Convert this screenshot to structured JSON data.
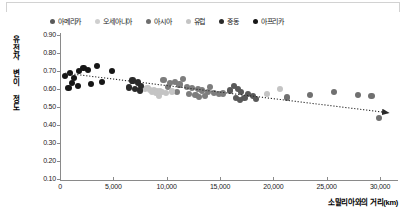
{
  "chart_data": {
    "type": "scatter",
    "title": "",
    "xlabel": "소말리아와의 거리(km)",
    "ylabel": "유전자 변이 정도",
    "xlim": [
      0,
      31500
    ],
    "ylim": [
      0.1,
      0.9
    ],
    "xticks": [
      0,
      5000,
      10000,
      15000,
      20000,
      25000,
      30000
    ],
    "xtick_labels": [
      "0",
      "5,000",
      "10,000",
      "15,000",
      "20,000",
      "25,000",
      "30,000"
    ],
    "yticks": [
      0.1,
      0.2,
      0.3,
      0.4,
      0.5,
      0.6,
      0.7,
      0.8,
      0.9
    ],
    "ytick_labels": [
      "0.10",
      "0.20",
      "0.30",
      "0.40",
      "0.50",
      "0.60",
      "0.70",
      "0.80",
      "0.90"
    ],
    "grid": false,
    "legend_position": "top",
    "trendline": {
      "type": "linear-arrow",
      "x_start": 500,
      "y_start": 0.688,
      "x_end": 30800,
      "y_end": 0.468,
      "style": "dotted",
      "color": "#2b2b2b",
      "arrowhead": true
    },
    "series": [
      {
        "name": "아메리카",
        "color": "#595959",
        "points": [
          [
            16300,
            0.617
          ],
          [
            16700,
            0.6
          ],
          [
            17000,
            0.585
          ],
          [
            17600,
            0.572
          ],
          [
            18100,
            0.563
          ],
          [
            15900,
            0.592
          ],
          [
            16500,
            0.552
          ],
          [
            17300,
            0.548
          ],
          [
            18400,
            0.545
          ],
          [
            16900,
            0.541
          ]
        ]
      },
      {
        "name": "오세아니아",
        "color": "#707070",
        "points": [
          [
            23400,
            0.567
          ],
          [
            25700,
            0.584
          ],
          [
            27900,
            0.565
          ],
          [
            29200,
            0.56
          ],
          [
            29900,
            0.439
          ],
          [
            21300,
            0.553
          ]
        ]
      },
      {
        "name": "아시아",
        "color": "#7d7d7d",
        "points": [
          [
            9700,
            0.648
          ],
          [
            10300,
            0.633
          ],
          [
            10800,
            0.64
          ],
          [
            11200,
            0.625
          ],
          [
            11900,
            0.612
          ],
          [
            12400,
            0.604
          ],
          [
            12900,
            0.598
          ],
          [
            13300,
            0.592
          ],
          [
            13900,
            0.585
          ],
          [
            14400,
            0.58
          ],
          [
            14900,
            0.573
          ],
          [
            12100,
            0.571
          ],
          [
            12700,
            0.565
          ],
          [
            13600,
            0.56
          ],
          [
            11500,
            0.657
          ],
          [
            10100,
            0.612
          ],
          [
            14100,
            0.612
          ],
          [
            15300,
            0.575
          ],
          [
            11000,
            0.585
          ],
          [
            13000,
            0.554
          ]
        ]
      },
      {
        "name": "유럽",
        "color": "#c4c4c4",
        "points": [
          [
            8000,
            0.6
          ],
          [
            8400,
            0.596
          ],
          [
            8800,
            0.592
          ],
          [
            9100,
            0.59
          ],
          [
            9400,
            0.588
          ],
          [
            8600,
            0.583
          ],
          [
            9000,
            0.58
          ],
          [
            9600,
            0.582
          ],
          [
            8200,
            0.605
          ],
          [
            9900,
            0.577
          ],
          [
            10500,
            0.586
          ],
          [
            9300,
            0.561
          ],
          [
            20600,
            0.601
          ],
          [
            19400,
            0.574
          ]
        ]
      },
      {
        "name": "중동",
        "color": "#2a2a2a",
        "points": [
          [
            6800,
            0.647
          ],
          [
            7300,
            0.636
          ],
          [
            7600,
            0.618
          ],
          [
            7000,
            0.6
          ],
          [
            7500,
            0.592
          ],
          [
            6500,
            0.608
          ]
        ]
      },
      {
        "name": "아프리카",
        "color": "#161616",
        "points": [
          [
            500,
            0.672
          ],
          [
            900,
            0.688
          ],
          [
            1300,
            0.662
          ],
          [
            1800,
            0.7
          ],
          [
            2200,
            0.716
          ],
          [
            2600,
            0.707
          ],
          [
            3500,
            0.729
          ],
          [
            1100,
            0.633
          ],
          [
            1700,
            0.618
          ],
          [
            2900,
            0.628
          ],
          [
            800,
            0.605
          ],
          [
            4900,
            0.7
          ],
          [
            3900,
            0.64
          ]
        ]
      }
    ]
  },
  "legend": {
    "items": [
      {
        "label": "아메리카",
        "color": "#595959"
      },
      {
        "label": "오세아니아",
        "color": "#cfcfcf"
      },
      {
        "label": "아시아",
        "color": "#6e6e6e"
      },
      {
        "label": "유럽",
        "color": "#c4c4c4"
      },
      {
        "label": "중동",
        "color": "#2a2a2a"
      },
      {
        "label": "아프리카",
        "color": "#161616"
      }
    ]
  },
  "y_axis_title_chars": "유전자 변이 정도"
}
